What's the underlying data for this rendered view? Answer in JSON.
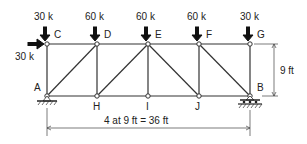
{
  "diagram": {
    "type": "Pratt-like truss with loads",
    "nodes": {
      "C": {
        "label": "C"
      },
      "D": {
        "label": "D"
      },
      "E": {
        "label": "E"
      },
      "F": {
        "label": "F"
      },
      "G": {
        "label": "G"
      },
      "A": {
        "label": "A"
      },
      "H": {
        "label": "H"
      },
      "I": {
        "label": "I"
      },
      "J": {
        "label": "J"
      },
      "B": {
        "label": "B"
      }
    },
    "loads": {
      "C_vertical": "30 k",
      "D_vertical": "60 k",
      "E_vertical": "60 k",
      "F_vertical": "60 k",
      "G_vertical": "30 k",
      "C_horizontal": "30 k"
    },
    "dimensions": {
      "height": "9 ft",
      "span": "4 at 9 ft = 36 ft"
    },
    "supports": {
      "A": "pin",
      "B": "roller"
    }
  }
}
